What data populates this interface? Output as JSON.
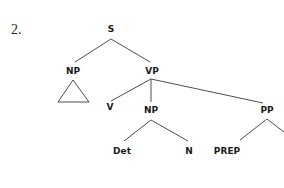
{
  "example": {
    "number": "2."
  },
  "tree": {
    "nodes": {
      "s": {
        "label": "S",
        "x": 111,
        "y": 25
      },
      "np_subject": {
        "label": "NP",
        "x": 73,
        "y": 67
      },
      "vp": {
        "label": "VP",
        "x": 152,
        "y": 67
      },
      "v": {
        "label": "V",
        "x": 110,
        "y": 103
      },
      "np_object": {
        "label": "NP",
        "x": 151,
        "y": 106
      },
      "pp": {
        "label": "PP",
        "x": 267,
        "y": 106
      },
      "det": {
        "label": "Det",
        "x": 122,
        "y": 147
      },
      "n": {
        "label": "N",
        "x": 189,
        "y": 147
      },
      "prep": {
        "label": "PREP",
        "x": 227,
        "y": 147
      }
    },
    "triangle_under": "np_subject",
    "edges": [
      [
        "s",
        "np_subject"
      ],
      [
        "s",
        "vp"
      ],
      [
        "vp",
        "v"
      ],
      [
        "vp",
        "np_object"
      ],
      [
        "vp",
        "pp"
      ],
      [
        "np_object",
        "det"
      ],
      [
        "np_object",
        "n"
      ],
      [
        "pp",
        "prep"
      ],
      [
        "pp",
        "(clipped)"
      ]
    ]
  }
}
